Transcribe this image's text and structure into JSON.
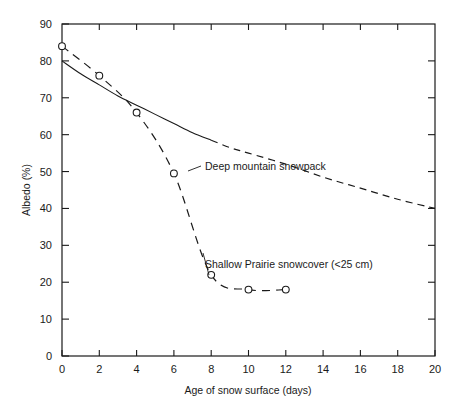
{
  "chart_data": {
    "type": "line",
    "title": "",
    "xlabel": "Age of snow surface (days)",
    "ylabel": "Albedo (%)",
    "xlim": [
      0,
      20
    ],
    "ylim": [
      0,
      90
    ],
    "xticks": [
      0,
      2,
      4,
      6,
      8,
      10,
      12,
      14,
      16,
      18,
      20
    ],
    "yticks": [
      0,
      10,
      20,
      30,
      40,
      50,
      60,
      70,
      80,
      90
    ],
    "grid": false,
    "legend_position": "inline-annotation",
    "series": [
      {
        "name": "Deep mountain snowpack",
        "style": "solid-then-dashed",
        "marker": "none",
        "label_text": "Deep mountain snowpack",
        "x": [
          0,
          1,
          2,
          3,
          4,
          5,
          6,
          7,
          8,
          9,
          10,
          12,
          14,
          16,
          18,
          20
        ],
        "y": [
          80,
          76.5,
          73.5,
          70.5,
          68,
          65.5,
          63,
          60.5,
          58.5,
          56.5,
          55,
          52,
          48.5,
          45.5,
          42.5,
          40
        ]
      },
      {
        "name": "Shallow Prairie snowcover (<25 cm)",
        "style": "dashed",
        "marker": "open-circle",
        "label_text": "Shallow Prairie snowcover (<25 cm)",
        "x": [
          0,
          2,
          4,
          6,
          8,
          10,
          12
        ],
        "y": [
          84,
          76,
          66,
          49.5,
          22,
          18,
          18
        ]
      }
    ],
    "annotations": [
      {
        "text": "Deep mountain snowpack",
        "x": 7.4,
        "y": 53.5
      },
      {
        "text": "Shallow Prairie snowcover (<25 cm)",
        "x": 7.3,
        "y": 28.5
      }
    ]
  },
  "axes": {
    "x_tick_labels": [
      "0",
      "2",
      "4",
      "6",
      "8",
      "10",
      "12",
      "14",
      "16",
      "18",
      "20"
    ],
    "y_tick_labels": [
      "0",
      "10",
      "20",
      "30",
      "40",
      "50",
      "60",
      "70",
      "80",
      "90"
    ],
    "x_axis_title": "Age of snow surface (days)",
    "y_axis_title": "Albedo (%)"
  }
}
